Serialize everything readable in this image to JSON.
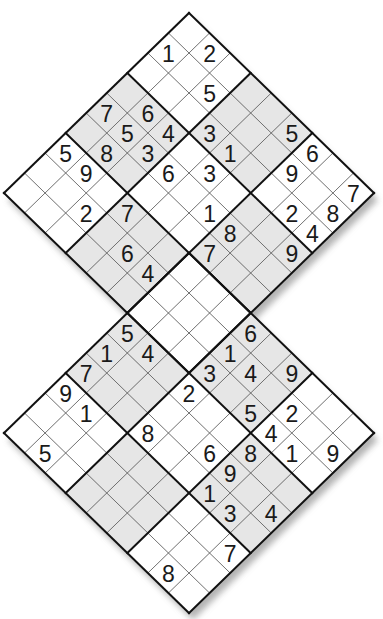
{
  "puzzle": {
    "type": "twin rotated sudoku (overlapping 9x9 grids)",
    "colors": {
      "background": "#ffffff",
      "cell_white": "#ffffff",
      "cell_shaded": "#e6e6e6",
      "thin_line": "#555555",
      "thick_line": "#111111",
      "shadow": "#9a9a9a",
      "digit": "#1a1a1a"
    },
    "grids": [
      {
        "name": "top-grid",
        "top_vertex": [
          189,
          13
        ],
        "givens": [
          {
            "r": 0,
            "c": 1,
            "v": "2"
          },
          {
            "r": 1,
            "c": 0,
            "v": "1"
          },
          {
            "r": 1,
            "c": 2,
            "v": "5"
          },
          {
            "r": 4,
            "c": 0,
            "v": "7"
          },
          {
            "r": 3,
            "c": 1,
            "v": "6"
          },
          {
            "r": 4,
            "c": 1,
            "v": "5"
          },
          {
            "r": 3,
            "c": 2,
            "v": "4"
          },
          {
            "r": 5,
            "c": 1,
            "v": "8"
          },
          {
            "r": 4,
            "c": 2,
            "v": "3"
          },
          {
            "r": 6,
            "c": 0,
            "v": "5"
          },
          {
            "r": 6,
            "c": 1,
            "v": "9"
          },
          {
            "r": 4,
            "c": 3,
            "v": "6"
          },
          {
            "r": 2,
            "c": 3,
            "v": "3"
          },
          {
            "r": 2,
            "c": 4,
            "v": "1"
          },
          {
            "r": 0,
            "c": 5,
            "v": "5"
          },
          {
            "r": 0,
            "c": 6,
            "v": "6"
          },
          {
            "r": 3,
            "c": 4,
            "v": "3"
          },
          {
            "r": 1,
            "c": 6,
            "v": "9"
          },
          {
            "r": 0,
            "c": 8,
            "v": "7"
          },
          {
            "r": 7,
            "c": 2,
            "v": "2"
          },
          {
            "r": 6,
            "c": 3,
            "v": "7"
          },
          {
            "r": 4,
            "c": 5,
            "v": "1"
          },
          {
            "r": 2,
            "c": 7,
            "v": "2"
          },
          {
            "r": 1,
            "c": 8,
            "v": "8"
          },
          {
            "r": 4,
            "c": 6,
            "v": "8"
          },
          {
            "r": 2,
            "c": 8,
            "v": "4"
          },
          {
            "r": 7,
            "c": 4,
            "v": "6"
          },
          {
            "r": 5,
            "c": 6,
            "v": "7"
          },
          {
            "r": 3,
            "c": 8,
            "v": "9"
          },
          {
            "r": 7,
            "c": 5,
            "v": "4"
          }
        ]
      },
      {
        "name": "bottom-grid",
        "top_vertex": [
          189,
          253
        ],
        "givens": [
          {
            "r": 3,
            "c": 0,
            "v": "5"
          },
          {
            "r": 4,
            "c": 0,
            "v": "1"
          },
          {
            "r": 3,
            "c": 1,
            "v": "4"
          },
          {
            "r": 5,
            "c": 0,
            "v": "7"
          },
          {
            "r": 6,
            "c": 0,
            "v": "9"
          },
          {
            "r": 3,
            "c": 3,
            "v": "2"
          },
          {
            "r": 2,
            "c": 3,
            "v": "3"
          },
          {
            "r": 6,
            "c": 1,
            "v": "1"
          },
          {
            "r": 0,
            "c": 3,
            "v": "6"
          },
          {
            "r": 1,
            "c": 3,
            "v": "1"
          },
          {
            "r": 1,
            "c": 4,
            "v": "4"
          },
          {
            "r": 0,
            "c": 5,
            "v": "9"
          },
          {
            "r": 2,
            "c": 5,
            "v": "5"
          },
          {
            "r": 1,
            "c": 6,
            "v": "2"
          },
          {
            "r": 2,
            "c": 6,
            "v": "4"
          },
          {
            "r": 5,
            "c": 3,
            "v": "8"
          },
          {
            "r": 8,
            "c": 1,
            "v": "5"
          },
          {
            "r": 4,
            "c": 5,
            "v": "6"
          },
          {
            "r": 3,
            "c": 6,
            "v": "8"
          },
          {
            "r": 2,
            "c": 7,
            "v": "1"
          },
          {
            "r": 1,
            "c": 8,
            "v": "9"
          },
          {
            "r": 4,
            "c": 6,
            "v": "9"
          },
          {
            "r": 5,
            "c": 6,
            "v": "1"
          },
          {
            "r": 5,
            "c": 7,
            "v": "3"
          },
          {
            "r": 4,
            "c": 8,
            "v": "4"
          },
          {
            "r": 6,
            "c": 8,
            "v": "7"
          },
          {
            "r": 8,
            "c": 7,
            "v": "8"
          }
        ]
      }
    ],
    "geometry": {
      "step_x": 20.56,
      "step_y": 20.0
    }
  }
}
